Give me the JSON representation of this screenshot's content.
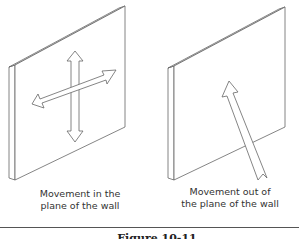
{
  "figure": {
    "panels": [
      {
        "id": "in-plane",
        "caption_line1": "Movement in the",
        "caption_line2": "plane of the wall",
        "arrows": [
          "vertical-double-arrow",
          "horizontal-double-arrow"
        ]
      },
      {
        "id": "out-of-plane",
        "caption_line1": "Movement out of",
        "caption_line2": "the plane of the wall",
        "arrows": [
          "perpendicular-arrow"
        ]
      }
    ],
    "caption": "Figure 10-11"
  },
  "colors": {
    "line": "#555555",
    "background": "#ffffff"
  }
}
